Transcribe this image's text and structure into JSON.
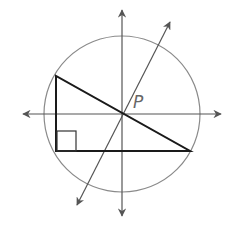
{
  "diagram": {
    "point_label": "P",
    "colors": {
      "circle": "#7a7a7a",
      "axes": "#555555",
      "triangle": "#1a1a1a",
      "label": "#666666"
    },
    "elements": {
      "circle": {
        "cx": 122,
        "cy": 114,
        "r": 78
      },
      "vertical_line": {
        "x": 122,
        "y1": 8,
        "y2": 218
      },
      "horizontal_line": {
        "y": 114,
        "x1": 21,
        "x2": 223
      },
      "diagonal_line": {
        "x1": 76,
        "y1": 207,
        "x2": 171,
        "y2": 20
      },
      "triangle": [
        [
          56,
          76
        ],
        [
          56,
          151
        ],
        [
          190,
          151
        ]
      ],
      "right_angle_box": {
        "x": 56,
        "y": 131,
        "size": 20
      }
    }
  }
}
